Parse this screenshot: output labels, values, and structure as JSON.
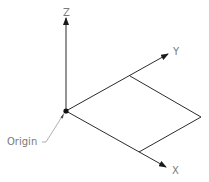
{
  "diagram": {
    "type": "3d-coordinate-axes",
    "axes": [
      {
        "name": "Z",
        "label": "Z"
      },
      {
        "name": "Y",
        "label": "Y"
      },
      {
        "name": "X",
        "label": "X"
      }
    ],
    "origin_label": "Origin",
    "colors": {
      "line": "#2b2b2b",
      "label": "#7a7a7a",
      "leader": "#9a9a9a"
    }
  }
}
